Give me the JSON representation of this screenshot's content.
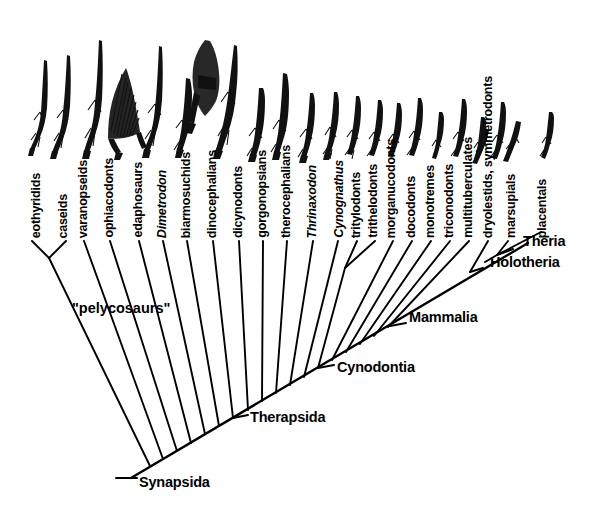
{
  "figure": {
    "type": "cladogram",
    "background_color": "#ffffff",
    "line_color": "#000000"
  },
  "tips": [
    {
      "id": "eothyridids",
      "label": "eothyridids",
      "italic": false,
      "x": 37,
      "silhouette": "quadruped-skeleton"
    },
    {
      "id": "caseids",
      "label": "caseids",
      "italic": false,
      "x": 64,
      "silhouette": "quadruped-skeleton"
    },
    {
      "id": "varanopseids",
      "label": "varanopseids",
      "italic": false,
      "x": 84,
      "silhouette": "quadruped-skeleton"
    },
    {
      "id": "ophiacodonts",
      "label": "ophiacodonts",
      "italic": false,
      "x": 110,
      "silhouette": "quadruped-skeleton"
    },
    {
      "id": "edaphosaurs",
      "label": "edaphosaurs",
      "italic": false,
      "x": 139,
      "silhouette": "sailback-skeleton"
    },
    {
      "id": "dimetrodon",
      "label": "Dimetrodon",
      "italic": true,
      "x": 163,
      "silhouette": "sailback-skeleton"
    },
    {
      "id": "biarmosuchids",
      "label": "biarmosuchids",
      "italic": false,
      "x": 187,
      "silhouette": "quadruped-skeleton"
    },
    {
      "id": "dinocephalians",
      "label": "dinocephalians",
      "italic": false,
      "x": 213,
      "silhouette": "heavy-skull"
    },
    {
      "id": "dicynodonts",
      "label": "dicynodonts",
      "italic": false,
      "x": 239,
      "silhouette": "quadruped-body"
    },
    {
      "id": "gorgonopsians",
      "label": "gorgonopsians",
      "italic": false,
      "x": 263,
      "silhouette": "quadruped-body"
    },
    {
      "id": "therocephalians",
      "label": "therocephalians",
      "italic": false,
      "x": 287,
      "silhouette": "quadruped-body"
    },
    {
      "id": "thrinaxodon",
      "label": "Thrinaxodon",
      "italic": true,
      "x": 313,
      "silhouette": "small-quadruped"
    },
    {
      "id": "cynognathus",
      "label": "Cynognathus",
      "italic": true,
      "x": 340,
      "silhouette": "small-quadruped"
    },
    {
      "id": "tritylodonts",
      "label": "tritylodonts",
      "italic": false,
      "x": 357,
      "silhouette": "small-quadruped"
    },
    {
      "id": "trithelodonts",
      "label": "trithelodonts",
      "italic": false,
      "x": 374,
      "silhouette": "small-quadruped"
    },
    {
      "id": "morganucodonts",
      "label": "morganucodonts",
      "italic": false,
      "x": 392,
      "silhouette": "small-quadruped"
    },
    {
      "id": "docodonts",
      "label": "docodonts",
      "italic": false,
      "x": 412,
      "silhouette": "tiny-mammal"
    },
    {
      "id": "monotremes",
      "label": "monotremes",
      "italic": false,
      "x": 431,
      "silhouette": "echidna"
    },
    {
      "id": "triconodonts",
      "label": "triconodonts",
      "italic": false,
      "x": 450,
      "silhouette": "tiny-mammal"
    },
    {
      "id": "multituberculates",
      "label": "multituberculates",
      "italic": false,
      "x": 469,
      "silhouette": "tiny-mammal"
    },
    {
      "id": "dryolestids_symmetrodonts",
      "label": "dryolestids, symmetrodonts",
      "italic": false,
      "x": 489,
      "silhouette": "tiny-mammal"
    },
    {
      "id": "marsupials",
      "label": "marsupials",
      "italic": false,
      "x": 512,
      "silhouette": "opossum"
    },
    {
      "id": "placentals",
      "label": "placentals",
      "italic": false,
      "x": 543,
      "silhouette": "small-mammal"
    }
  ],
  "node_labels": [
    {
      "id": "synapsida",
      "label": "Synapsida",
      "x": 139,
      "y": 484
    },
    {
      "id": "therapsida",
      "label": "Therapsida",
      "x": 250,
      "y": 419
    },
    {
      "id": "cynodontia",
      "label": "Cynodontia",
      "x": 337,
      "y": 369
    },
    {
      "id": "mammalia",
      "label": "Mammalia",
      "x": 409,
      "y": 319
    },
    {
      "id": "holotheria",
      "label": "Holotheria",
      "x": 490,
      "y": 264
    },
    {
      "id": "theria",
      "label": "Theria",
      "x": 523,
      "y": 243
    }
  ],
  "clade_annotations": [
    {
      "id": "pelycosaurs",
      "label": "\"pelycosaurs\"",
      "x": 72,
      "y": 300
    }
  ]
}
